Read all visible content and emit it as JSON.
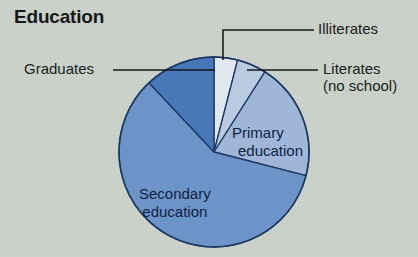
{
  "figure": {
    "title": "Education",
    "background_color": "#ccd3cb",
    "text_color": "#1a1c20"
  },
  "labels": {
    "graduates": "Graduates",
    "illiterates": "Illiterates",
    "literates_line1": "Literates",
    "literates_line2": "(no school)",
    "primary_line1": "Primary",
    "primary_line2": "education",
    "secondary_line1": "Secondary",
    "secondary_line2": "education"
  },
  "chart_data": {
    "type": "pie",
    "title": "Education",
    "xlabel": "",
    "ylabel": "",
    "grid": false,
    "legend_position": "none",
    "label_placement": "leader-lines outside for small slices, inline text for large slices",
    "start_angle_deg": -90,
    "direction": "clockwise",
    "center_px": [
      214,
      152
    ],
    "radius_px": 95,
    "outline_color": "#1d3a63",
    "categories": [
      "Illiterates",
      "Literates (no school)",
      "Primary education",
      "Secondary education",
      "Graduates"
    ],
    "values": [
      4,
      5,
      20,
      59,
      12
    ],
    "unit": "percent",
    "slices": [
      {
        "name": "Illiterates",
        "value": 4,
        "color": "#dfe7ef",
        "start_angle_deg": -90,
        "end_angle_deg": -75.6,
        "label_type": "leader-line"
      },
      {
        "name": "Literates (no school)",
        "value": 5,
        "color": "#b9cae1",
        "start_angle_deg": -75.6,
        "end_angle_deg": -57.6,
        "label_type": "leader-line"
      },
      {
        "name": "Primary education",
        "value": 20,
        "color": "#9fb6d8",
        "start_angle_deg": -57.6,
        "end_angle_deg": 14.4,
        "label_type": "inline"
      },
      {
        "name": "Secondary education",
        "value": 59,
        "color": "#6d94c8",
        "start_angle_deg": 14.4,
        "end_angle_deg": 226.8,
        "label_type": "inline"
      },
      {
        "name": "Graduates",
        "value": 12,
        "color": "#4878b8",
        "start_angle_deg": 226.8,
        "end_angle_deg": 270,
        "label_type": "leader-line"
      }
    ]
  }
}
